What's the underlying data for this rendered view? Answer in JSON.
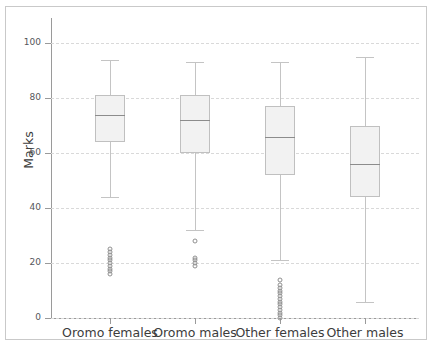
{
  "chart_data": {
    "type": "boxplot",
    "title": "",
    "xlabel": "",
    "ylabel": "Marks",
    "ylim": [
      0,
      105
    ],
    "yticks": [
      0,
      20,
      40,
      60,
      80,
      100
    ],
    "grid": true,
    "legend": "none",
    "categories": [
      "Oromo females",
      "Oromo males",
      "Other females",
      "Other males"
    ],
    "boxes": [
      {
        "category": "Oromo females",
        "whisker_low": 44,
        "q1": 64,
        "median": 74,
        "q3": 81,
        "whisker_high": 94,
        "outliers": [
          25,
          24,
          23,
          22,
          21,
          20,
          19,
          18,
          17,
          16
        ]
      },
      {
        "category": "Oromo males",
        "whisker_low": 32,
        "q1": 60,
        "median": 72,
        "q3": 81,
        "whisker_high": 93,
        "outliers": [
          28,
          22,
          21,
          20,
          19
        ]
      },
      {
        "category": "Other females",
        "whisker_low": 21,
        "q1": 52,
        "median": 66,
        "q3": 77,
        "whisker_high": 93,
        "outliers": [
          14,
          12,
          11,
          10,
          9,
          8,
          7,
          6,
          5,
          4,
          3,
          2,
          1,
          0
        ]
      },
      {
        "category": "Other males",
        "whisker_low": 6,
        "q1": 44,
        "median": 56,
        "q3": 70,
        "whisker_high": 95,
        "outliers": []
      }
    ],
    "colors": {
      "box_fill": "#f2f2f2",
      "box_edge": "#c0c0c0",
      "median": "#8c8c8c",
      "whisker": "#c4c4c4",
      "outlier_edge": "#909090",
      "gridline": "#d9d9d9",
      "axis": "#9a9a9a",
      "tick_label": "#55565a",
      "axis_label": "#3c3c3c",
      "background": "#ffffff"
    }
  }
}
